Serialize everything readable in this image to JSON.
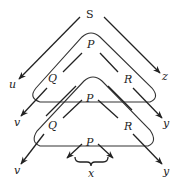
{
  "diagram": {
    "title": "",
    "nodes": {
      "top": "S",
      "level1": {
        "apex": "P",
        "left": "Q",
        "right": "R"
      },
      "level2": {
        "apex": "P",
        "left": "Q",
        "right": "R"
      },
      "level3": {
        "apex": "P"
      }
    },
    "outputs": {
      "s_left": "u",
      "s_right": "z",
      "l1_left": "v",
      "l1_right": "y",
      "l2_left": "v",
      "l2_right": "y",
      "brace": "x"
    },
    "colors": {
      "ink": "#222222",
      "background": "#ffffff"
    }
  }
}
